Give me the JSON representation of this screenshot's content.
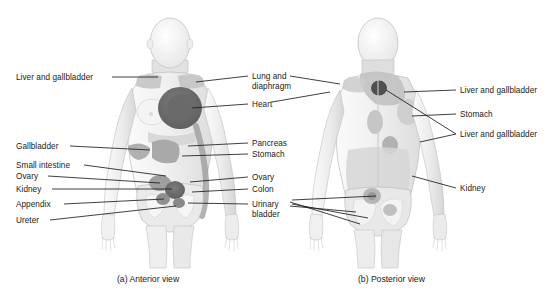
{
  "figure": {
    "background_color": "#ffffff",
    "text_color": "#1a1a1a",
    "leader_line_color": "#1d1d1d"
  },
  "palette": {
    "body_fill": "#f2f2f2",
    "body_outline": "#b4b4b4",
    "body_shade": "#dcdcdc",
    "organ_light": "#c9c9c9",
    "organ_mid": "#a8a8a8",
    "organ_dark": "#6e6e6e",
    "organ_darkest": "#4f4f4f"
  },
  "panels": [
    {
      "id": "anterior",
      "caption": "(a) Anterior view"
    },
    {
      "id": "posterior",
      "caption": "(b) Posterior view"
    }
  ],
  "labels": {
    "anterior_left": [
      {
        "text": "Liver and gallbladder",
        "x": 16,
        "y": 73
      },
      {
        "text": "Gallbladder",
        "x": 16,
        "y": 142
      },
      {
        "text": "Small intestine",
        "x": 16,
        "y": 161
      },
      {
        "text": "Ovary",
        "x": 16,
        "y": 172
      },
      {
        "text": "Kidney",
        "x": 16,
        "y": 185
      },
      {
        "text": "Appendix",
        "x": 16,
        "y": 200
      },
      {
        "text": "Ureter",
        "x": 16,
        "y": 216
      }
    ],
    "anterior_right": [
      {
        "text": "Lung and",
        "x": 252,
        "y": 72
      },
      {
        "text": "diaphragm",
        "x": 252,
        "y": 82
      },
      {
        "text": "Heart",
        "x": 252,
        "y": 100
      },
      {
        "text": "Pancreas",
        "x": 252,
        "y": 139
      },
      {
        "text": "Stomach",
        "x": 252,
        "y": 150
      },
      {
        "text": "Ovary",
        "x": 252,
        "y": 173
      },
      {
        "text": "Colon",
        "x": 252,
        "y": 185
      },
      {
        "text": "Urinary",
        "x": 252,
        "y": 200
      },
      {
        "text": "bladder",
        "x": 252,
        "y": 210
      }
    ],
    "posterior_right": [
      {
        "text": "Liver and gallbladder",
        "x": 460,
        "y": 86
      },
      {
        "text": "Stomach",
        "x": 460,
        "y": 110
      },
      {
        "text": "Liver and gallbladder",
        "x": 460,
        "y": 130
      },
      {
        "text": "Kidney",
        "x": 460,
        "y": 184
      }
    ]
  },
  "captions": {
    "anterior": {
      "text": "(a) Anterior view",
      "x": 117,
      "y": 274
    },
    "posterior": {
      "text": "(b) Posterior view",
      "x": 358,
      "y": 274
    }
  }
}
